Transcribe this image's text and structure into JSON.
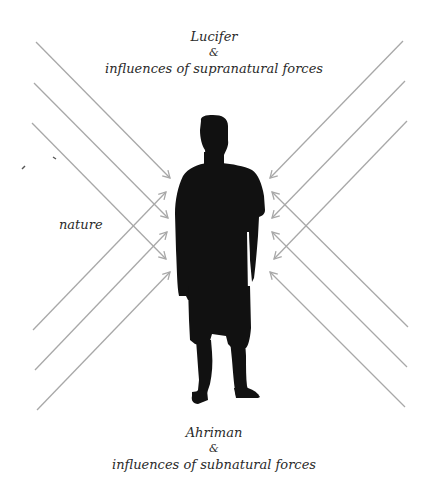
{
  "top_label": {
    "line1": "Lucifer",
    "line2": "&",
    "line3": "influences of supranatural forces"
  },
  "bottom_label": {
    "line1": "Ahriman",
    "line2": "&",
    "line3": "influences of subnatural forces"
  },
  "side_label": "nature",
  "colors": {
    "arrow": "#a8a8a8",
    "silhouette": "#111111",
    "text": "#2a2a2a"
  }
}
